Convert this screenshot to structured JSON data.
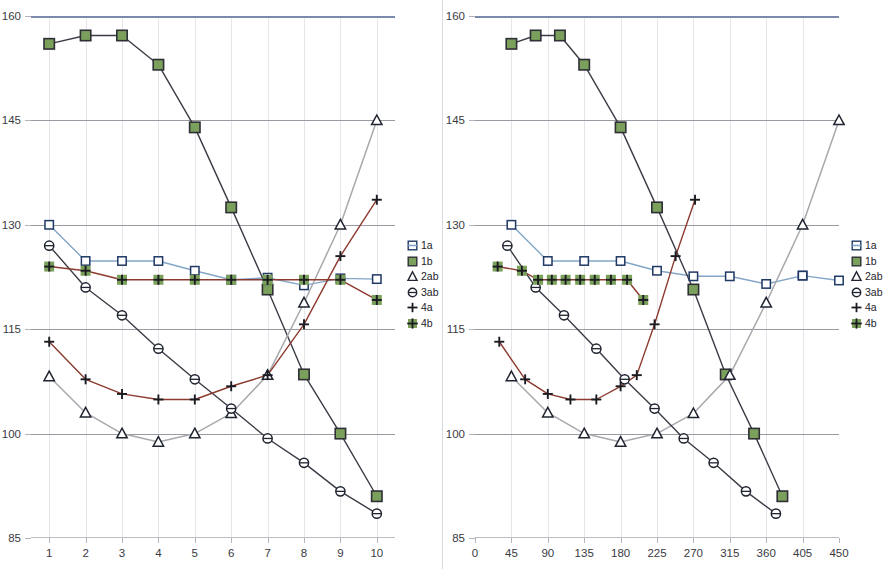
{
  "figure": {
    "panel_count": 2,
    "background": "#ffffff"
  },
  "colors": {
    "series_1a_line": "#83a6c8",
    "series_1a_marker_stroke": "#1f3864",
    "series_1b_line": "#3b3b46",
    "series_1b_marker_fill": "#7ba05b",
    "series_1b_marker_stroke": "#2f2f38",
    "series_2ab_line": "#a8a8ad",
    "series_2ab_marker_stroke": "#1f2430",
    "series_3ab_line": "#3b3b46",
    "series_3ab_marker_stroke": "#1f2430",
    "series_4a_line": "#8c3a2e",
    "series_4a_marker_stroke": "#1b1b22",
    "series_4b_line": "#8c3a2e",
    "series_4b_marker_fill": "#7ba05b",
    "series_4b_marker_stroke": "#1b1b22",
    "gridline_major": "#9a9aa2",
    "gridline_minor": "#e6e6ea",
    "axis_top": "#7b8aa8",
    "tick": "#b4b4bc",
    "text": "#3a3a3f"
  },
  "legend": {
    "position": "right",
    "entries": [
      {
        "label": "1a",
        "marker": "open-square",
        "icon_name": "legend-marker-open-square"
      },
      {
        "label": "1b",
        "marker": "filled-green-square",
        "icon_name": "legend-marker-green-square"
      },
      {
        "label": "2ab",
        "marker": "open-triangle",
        "icon_name": "legend-marker-open-triangle"
      },
      {
        "label": "3ab",
        "marker": "open-circle",
        "icon_name": "legend-marker-open-circle"
      },
      {
        "label": "4a",
        "marker": "plus",
        "icon_name": "legend-marker-plus"
      },
      {
        "label": "4b",
        "marker": "green-square-plus",
        "icon_name": "legend-marker-green-square-plus"
      }
    ]
  },
  "chart_data": [
    {
      "id": "left-chart",
      "type": "line",
      "title": "",
      "xlabel": "",
      "ylabel": "",
      "xlim": [
        0.5,
        10.5
      ],
      "ylim": [
        85,
        160
      ],
      "yticks": [
        85,
        100,
        115,
        130,
        145,
        160
      ],
      "xticks": [
        1,
        2,
        3,
        4,
        5,
        6,
        7,
        8,
        9,
        10
      ],
      "xtick_labels": [
        "1",
        "2",
        "3",
        "4",
        "5",
        "6",
        "7",
        "8",
        "9",
        "10"
      ],
      "ytick_labels": [
        "85",
        "100",
        "115",
        "130",
        "145",
        "160"
      ],
      "grid": {
        "horizontal": true,
        "vertical": true
      },
      "legend_position": "right",
      "x": [
        1,
        2,
        3,
        4,
        5,
        6,
        7,
        8,
        9,
        10
      ],
      "series": [
        {
          "name": "1a",
          "marker": "open-square",
          "values": [
            130.0,
            124.8,
            124.8,
            124.8,
            123.4,
            122.1,
            122.4,
            121.3,
            122.3,
            122.2
          ]
        },
        {
          "name": "1b",
          "marker": "filled-green-square",
          "values": [
            156.0,
            157.2,
            157.2,
            153.0,
            144.0,
            132.5,
            120.7,
            108.5,
            100.0,
            91.0
          ]
        },
        {
          "name": "2ab",
          "marker": "open-triangle",
          "values": [
            108.2,
            103.0,
            100.0,
            98.8,
            100.0,
            102.9,
            108.4,
            118.8,
            130.0,
            145.0
          ]
        },
        {
          "name": "3ab",
          "marker": "open-circle",
          "values": [
            127.0,
            121.0,
            117.0,
            112.2,
            107.8,
            103.6,
            99.3,
            95.8,
            91.7,
            88.5
          ]
        },
        {
          "name": "4a",
          "marker": "plus",
          "values": [
            113.2,
            107.8,
            105.7,
            104.9,
            104.9,
            106.8,
            108.4,
            115.7,
            125.5,
            133.6
          ]
        },
        {
          "name": "4b",
          "marker": "green-square-plus",
          "values": [
            124.0,
            123.4,
            122.1,
            122.1,
            122.1,
            122.1,
            122.1,
            122.1,
            122.1,
            119.2
          ]
        }
      ]
    },
    {
      "id": "right-chart",
      "type": "line",
      "title": "",
      "xlabel": "",
      "ylabel": "",
      "xlim": [
        0,
        450
      ],
      "ylim": [
        85,
        160
      ],
      "yticks": [
        85,
        100,
        115,
        130,
        145,
        160
      ],
      "xticks": [
        0,
        45,
        90,
        135,
        180,
        225,
        270,
        315,
        360,
        405,
        450
      ],
      "xtick_labels": [
        "0",
        "45",
        "90",
        "135",
        "180",
        "225",
        "270",
        "315",
        "360",
        "405",
        "450"
      ],
      "ytick_labels": [
        "85",
        "100",
        "115",
        "130",
        "145",
        "160"
      ],
      "grid": {
        "horizontal": true,
        "vertical": true
      },
      "legend_position": "right",
      "series": [
        {
          "name": "1a",
          "marker": "open-square",
          "x": [
            45,
            90,
            135,
            180,
            225,
            270,
            315,
            360,
            405
          ],
          "values": [
            130.0,
            124.8,
            124.8,
            124.8,
            123.4,
            122.6,
            122.6,
            121.5,
            122.7
          ]
        },
        {
          "name": "1a-tail",
          "marker": "open-square",
          "x": [
            405,
            450
          ],
          "values": [
            122.7,
            122.0
          ]
        },
        {
          "name": "1b",
          "marker": "filled-green-square",
          "x": [
            45,
            75,
            105,
            135,
            180,
            225,
            270,
            310,
            345,
            380
          ],
          "values": [
            156.0,
            157.2,
            157.2,
            153.0,
            144.0,
            132.5,
            120.7,
            108.5,
            100.0,
            91.0
          ]
        },
        {
          "name": "2ab",
          "marker": "open-triangle",
          "x": [
            45,
            90,
            135,
            180,
            225,
            270,
            315,
            360,
            405,
            450
          ],
          "values": [
            108.2,
            103.0,
            100.0,
            98.8,
            100.0,
            102.9,
            108.4,
            118.8,
            130.0,
            145.0
          ]
        },
        {
          "name": "3ab",
          "marker": "open-circle",
          "x": [
            40,
            75,
            110,
            150,
            185,
            222,
            258,
            295,
            335,
            372
          ],
          "values": [
            127.0,
            121.0,
            117.0,
            112.2,
            107.8,
            103.6,
            99.3,
            95.8,
            91.7,
            88.5
          ]
        },
        {
          "name": "4a",
          "marker": "plus",
          "x": [
            30,
            62,
            90,
            118,
            150,
            180,
            200,
            222,
            248,
            272
          ],
          "values": [
            113.2,
            107.8,
            105.7,
            104.9,
            104.9,
            106.8,
            108.4,
            115.7,
            125.5,
            133.6
          ]
        },
        {
          "name": "4b",
          "marker": "green-square-plus",
          "x": [
            28,
            58,
            78,
            95,
            112,
            130,
            148,
            168,
            188,
            208
          ],
          "values": [
            124.0,
            123.4,
            122.1,
            122.1,
            122.1,
            122.1,
            122.1,
            122.1,
            122.1,
            119.2
          ]
        }
      ]
    }
  ]
}
